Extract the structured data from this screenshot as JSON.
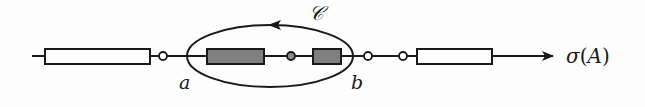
{
  "diagram": {
    "type": "spectrum-contour",
    "colors": {
      "line": "#1a1a1a",
      "spectral_fill": "#7f7f7f",
      "background": "#fdfdfd"
    },
    "contour": {
      "label": "𝒞",
      "orientation": "counterclockwise"
    },
    "endpoints": {
      "left": "a",
      "right": "b"
    },
    "axis_label": {
      "sigma": "σ",
      "open_paren": "(",
      "operator": "A",
      "close_paren": ")"
    },
    "segments": [
      {
        "id": "spectrum-part-1",
        "enclosed": false
      },
      {
        "id": "spectrum-part-2",
        "enclosed": true
      },
      {
        "id": "spectrum-part-3",
        "enclosed": true
      },
      {
        "id": "spectrum-part-4",
        "enclosed": false
      }
    ],
    "points": [
      {
        "id": "gap-point-1",
        "enclosed": false
      },
      {
        "id": "inner-point",
        "enclosed": true
      },
      {
        "id": "gap-point-2",
        "enclosed": false
      },
      {
        "id": "gap-point-3",
        "enclosed": false
      }
    ]
  }
}
